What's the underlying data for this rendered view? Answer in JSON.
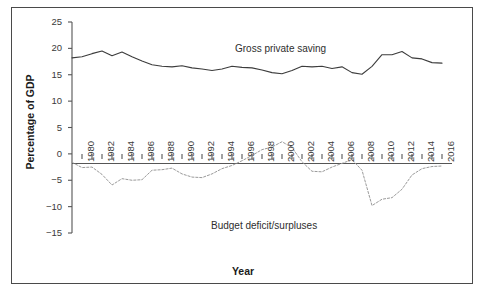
{
  "figure": {
    "background": "#ffffff",
    "frame_color": "#4a4a4a"
  },
  "axes": {
    "ylabel": "Percentage of GDP",
    "xlabel": "Year",
    "y_ticks": [
      "25",
      "20",
      "15",
      "10",
      "5",
      "0",
      "−5",
      "−10",
      "−15"
    ],
    "x_ticks": [
      "1980",
      "1982",
      "1984",
      "1986",
      "1988",
      "1990",
      "1992",
      "1994",
      "1996",
      "1998",
      "2000",
      "2002",
      "2004",
      "2006",
      "2008",
      "2010",
      "2012",
      "2014",
      "2016"
    ]
  },
  "annotations": {
    "saving": "Gross private saving",
    "budget": "Budget  deficit/surpluses"
  },
  "chart_data": {
    "type": "line",
    "title": "",
    "xlabel": "Year",
    "ylabel": "Percentage of GDP",
    "xlim": [
      1979,
      2017
    ],
    "ylim": [
      -15,
      25
    ],
    "grid": false,
    "legend": "inline-annotations",
    "x": [
      1979,
      1980,
      1981,
      1982,
      1983,
      1984,
      1985,
      1986,
      1987,
      1988,
      1989,
      1990,
      1991,
      1992,
      1993,
      1994,
      1995,
      1996,
      1997,
      1998,
      1999,
      2000,
      2001,
      2002,
      2003,
      2004,
      2005,
      2006,
      2007,
      2008,
      2009,
      2010,
      2011,
      2012,
      2013,
      2014,
      2015,
      2016
    ],
    "series": [
      {
        "name": "Gross private saving",
        "color": "#3c3c3c",
        "style": "solid",
        "values": [
          18.2,
          18.4,
          19.0,
          19.5,
          18.6,
          19.3,
          18.4,
          17.6,
          16.9,
          16.6,
          16.5,
          16.7,
          16.3,
          16.1,
          15.8,
          16.1,
          16.6,
          16.4,
          16.3,
          15.9,
          15.4,
          15.2,
          15.8,
          16.6,
          16.5,
          16.6,
          16.2,
          16.5,
          15.4,
          15.1,
          16.6,
          18.8,
          18.8,
          19.4,
          18.2,
          18.0,
          17.3,
          17.2
        ]
      },
      {
        "name": "Budget deficit/surpluses",
        "color": "#9a9a9a",
        "style": "dashed",
        "values": [
          -1.6,
          -2.6,
          -2.5,
          -3.9,
          -5.9,
          -4.7,
          -5.0,
          -4.9,
          -3.1,
          -3.0,
          -2.7,
          -3.8,
          -4.4,
          -4.5,
          -3.8,
          -2.8,
          -2.2,
          -1.3,
          -0.3,
          0.8,
          1.3,
          2.3,
          1.2,
          -1.5,
          -3.3,
          -3.4,
          -2.5,
          -1.8,
          -1.1,
          -3.1,
          -9.8,
          -8.6,
          -8.3,
          -6.7,
          -4.0,
          -2.8,
          -2.4,
          -2.3
        ]
      }
    ]
  }
}
